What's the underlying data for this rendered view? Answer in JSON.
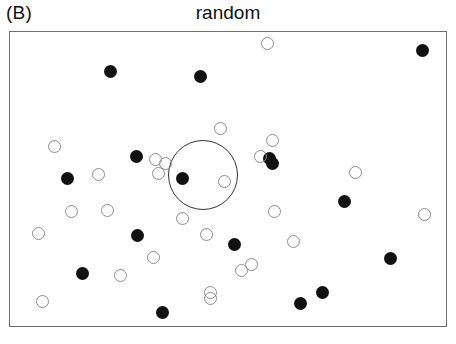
{
  "panel": {
    "label": "(B)"
  },
  "chart_data": {
    "type": "scatter",
    "title": "random",
    "xlabel": "",
    "ylabel": "",
    "xlim": [
      0,
      438
    ],
    "ylim": [
      0,
      296
    ],
    "grid": false,
    "legend": null,
    "frame": {
      "x": 9,
      "y": 31,
      "width": 438,
      "height": 296
    },
    "marker_radius": 6.5,
    "colors": {
      "filled": "#111111",
      "open_stroke": "#8c8c8c",
      "frame": "#6f6f6f",
      "circle": "#333333"
    },
    "annotations": [
      {
        "name": "focus-circle",
        "type": "circle",
        "cx": 193,
        "cy": 143,
        "r": 35
      }
    ],
    "series": [
      {
        "name": "filled",
        "marker": "filled-circle",
        "count": 16,
        "points": [
          {
            "x": 100,
            "y": 39
          },
          {
            "x": 190,
            "y": 44
          },
          {
            "x": 412,
            "y": 18
          },
          {
            "x": 57,
            "y": 146
          },
          {
            "x": 126,
            "y": 124
          },
          {
            "x": 172,
            "y": 146
          },
          {
            "x": 259,
            "y": 126
          },
          {
            "x": 262,
            "y": 131
          },
          {
            "x": 334,
            "y": 169
          },
          {
            "x": 127,
            "y": 203
          },
          {
            "x": 224,
            "y": 212
          },
          {
            "x": 72,
            "y": 241
          },
          {
            "x": 152,
            "y": 280
          },
          {
            "x": 290,
            "y": 271
          },
          {
            "x": 380,
            "y": 226
          },
          {
            "x": 312,
            "y": 260
          }
        ]
      },
      {
        "name": "open",
        "marker": "open-circle",
        "count": 26,
        "points": [
          {
            "x": 257,
            "y": 11
          },
          {
            "x": 210,
            "y": 96
          },
          {
            "x": 44,
            "y": 114
          },
          {
            "x": 88,
            "y": 142
          },
          {
            "x": 145,
            "y": 127
          },
          {
            "x": 155,
            "y": 131
          },
          {
            "x": 148,
            "y": 141
          },
          {
            "x": 250,
            "y": 124
          },
          {
            "x": 214,
            "y": 149
          },
          {
            "x": 262,
            "y": 108
          },
          {
            "x": 264,
            "y": 179
          },
          {
            "x": 345,
            "y": 140
          },
          {
            "x": 61,
            "y": 179
          },
          {
            "x": 97,
            "y": 178
          },
          {
            "x": 28,
            "y": 201
          },
          {
            "x": 172,
            "y": 186
          },
          {
            "x": 283,
            "y": 209
          },
          {
            "x": 414,
            "y": 182
          },
          {
            "x": 196,
            "y": 202
          },
          {
            "x": 143,
            "y": 225
          },
          {
            "x": 110,
            "y": 243
          },
          {
            "x": 200,
            "y": 266
          },
          {
            "x": 231,
            "y": 238
          },
          {
            "x": 241,
            "y": 232
          },
          {
            "x": 32,
            "y": 269
          },
          {
            "x": 200,
            "y": 260
          }
        ]
      }
    ]
  }
}
